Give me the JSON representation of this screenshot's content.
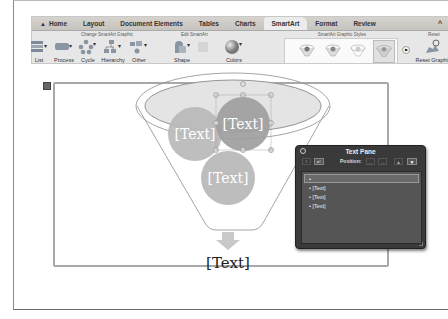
{
  "ribbon": {
    "tabs": [
      {
        "label": "Home",
        "icon": "home-icon"
      },
      {
        "label": "Layout"
      },
      {
        "label": "Document Elements"
      },
      {
        "label": "Tables"
      },
      {
        "label": "Charts"
      },
      {
        "label": "SmartArt",
        "active": true
      },
      {
        "label": "Format"
      },
      {
        "label": "Review"
      }
    ],
    "collapse_glyph": "^",
    "groups": {
      "change": "Change SmartArt Graphic",
      "edit": "Edit SmartArt",
      "styles": "SmartArt Graphic Styles",
      "reset": "Reset"
    },
    "buttons": {
      "list": "List",
      "process": "Process",
      "cycle": "Cycle",
      "hierarchy": "Hierarchy",
      "other": "Other",
      "shape": "Shape",
      "colors": "Colors",
      "reset_graphic": "Reset Graphic"
    }
  },
  "graphic": {
    "circle_top_left": "[Text]",
    "circle_top_right": "[Text]",
    "circle_bottom": "[Text]",
    "result": "[Text]"
  },
  "text_pane": {
    "title": "Text Pane",
    "position_label": "Position:",
    "items": [
      "",
      "[Text]",
      "[Text]",
      "[Text]"
    ]
  }
}
